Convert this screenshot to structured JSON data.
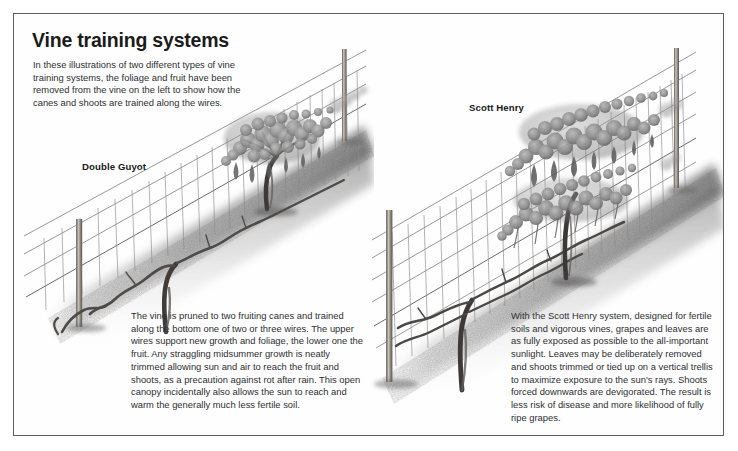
{
  "page": {
    "title": "Vine training systems",
    "intro": "In these illustrations of two different types of vine training systems, the foliage and fruit have been removed from the vine on the left to show how the canes and shoots are trained along the wires.",
    "border_color": "#5b5f63",
    "background_color": "#ffffff",
    "ink_color": "#2c2f31"
  },
  "diagrams": {
    "left": {
      "label": "Double Guyot",
      "caption": "The vine is pruned to two fruiting canes and trained along the bottom one of two or three wires. The upper wires support new growth and foliage, the lower one the fruit. Any straggling midsummer growth is neatly trimmed allowing sun and air to reach the fruit and shoots, as a precaution against rot after rain. This open canopy incidentally also allows the sun to reach and warm the generally much less fertile soil."
    },
    "right": {
      "label": "Scott Henry",
      "caption": "With the Scott Henry system, designed for fertile soils and vigorous vines, grapes and leaves are as fully exposed as possible to the all-important sunlight. Leaves may be deliberately removed and shoots trimmed or tied up on a vertical trellis to maximize exposure to the sun's rays. Shoots forced downwards are devigorated. The result is less risk of disease and more likelihood of fully ripe grapes."
    }
  }
}
